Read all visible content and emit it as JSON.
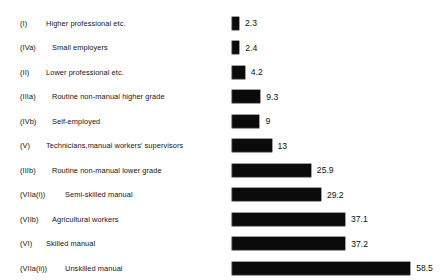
{
  "chart_data": {
    "type": "bar",
    "orientation": "horizontal",
    "title": "",
    "subtitle": "",
    "xlabel": "",
    "ylabel": "",
    "grid": false,
    "legend": null,
    "axis_visible": false,
    "tick_labels": [],
    "xlim": [
      0,
      58.5
    ],
    "value_labels_shown": true,
    "categories": [
      "(I)  Higher professional etc.",
      "(IVa)  Small employers",
      "(II)  Lower professional etc.",
      "(IIIa)  Routine non-manual higher grade",
      "(IVb)  Self-employed",
      "(V)  Technicians,manual workers' supervisors",
      "(IIIb)  Routine non-manual lower grade",
      "(VIIa(i))  Semi-skilled manual",
      "(VIIb)  Agricultural workers",
      "(VI)  Skilled manual",
      "(VIIa(ii))  Unskilled manual"
    ],
    "values": [
      2.3,
      2.4,
      4.2,
      9.3,
      9,
      13,
      25.9,
      29.2,
      37.1,
      37.2,
      58.5
    ],
    "value_label_text": [
      "2.3",
      "2.4",
      "4.2",
      "9.3",
      "9",
      "13",
      "25.9",
      "29.2",
      "37.1",
      "37.2",
      "58.5"
    ]
  },
  "rows": [
    {
      "code": "(I)",
      "code_width": 26,
      "desc": "Higher professional etc.",
      "value": 2.3,
      "value_text": "2.3"
    },
    {
      "code": "(IVa)",
      "code_width": 32,
      "desc": "Small employers",
      "value": 2.4,
      "value_text": "2.4"
    },
    {
      "code": "(II)",
      "code_width": 26,
      "desc": "Lower professional etc.",
      "value": 4.2,
      "value_text": "4.2"
    },
    {
      "code": "(IIIa)",
      "code_width": 32,
      "desc": "Routine non-manual higher grade",
      "value": 9.3,
      "value_text": "9.3"
    },
    {
      "code": "(IVb)",
      "code_width": 32,
      "desc": "Self-employed",
      "value": 9,
      "value_text": "9"
    },
    {
      "code": "(V)",
      "code_width": 26,
      "desc": "Technicians,manual workers' supervisors",
      "value": 13,
      "value_text": "13"
    },
    {
      "code": "(IIIb)",
      "code_width": 32,
      "desc": "Routine non-manual lower grade",
      "value": 25.9,
      "value_text": "25.9"
    },
    {
      "code": "(VIIa(i))",
      "code_width": 45,
      "desc": "Semi-skilled manual",
      "value": 29.2,
      "value_text": "29.2"
    },
    {
      "code": "(VIIb)",
      "code_width": 32,
      "desc": "Agricultural workers",
      "value": 37.1,
      "value_text": "37.1"
    },
    {
      "code": "(VI)",
      "code_width": 26,
      "desc": "Skilled manual",
      "value": 37.2,
      "value_text": "37.2"
    },
    {
      "code": "(VIIa(ii))",
      "code_width": 45,
      "desc": "Unskilled manual",
      "value": 58.5,
      "value_text": "58.5"
    }
  ],
  "style": {
    "bar_color": "#0b0b0b",
    "text_color": "#141414",
    "background": "#ffffff",
    "px_per_unit": 3.045,
    "bar_origin_x": 232,
    "row_pitch": 24.5,
    "first_row_top": 11
  }
}
